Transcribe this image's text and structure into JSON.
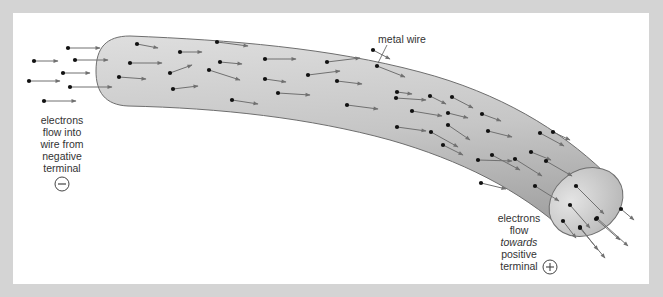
{
  "diagram": {
    "colors": {
      "frame": "#d4d4d4",
      "background": "#ffffff",
      "wire_fill_light": "#e2e2e2",
      "wire_fill_dark": "#a9a9a9",
      "wire_outline": "#6e6e6e",
      "electron": "#111111",
      "arrow": "#707070",
      "text": "#333333"
    },
    "labels": {
      "wire": "metal wire",
      "negative_end": [
        "electrons",
        "flow into",
        "wire from",
        "negative",
        "terminal"
      ],
      "positive_end": [
        "electrons",
        "flow",
        "towards",
        "positive",
        "terminal"
      ],
      "negative_symbol": "−",
      "positive_symbol": "+"
    },
    "electrons_outside_left": [
      [
        68,
        48,
        100,
        48
      ],
      [
        34,
        61,
        58,
        61
      ],
      [
        75,
        60,
        108,
        60
      ],
      [
        63,
        73,
        90,
        73
      ],
      [
        29,
        81,
        60,
        81
      ],
      [
        70,
        87,
        112,
        87
      ],
      [
        44,
        101,
        76,
        101
      ]
    ],
    "electrons_in_wire": [
      [
        137,
        44,
        158,
        48
      ],
      [
        180,
        52,
        202,
        52
      ],
      [
        130,
        63,
        162,
        63
      ],
      [
        170,
        73,
        192,
        65
      ],
      [
        119,
        77,
        146,
        79
      ],
      [
        209,
        70,
        240,
        80
      ],
      [
        173,
        89,
        198,
        86
      ],
      [
        217,
        42,
        248,
        46
      ],
      [
        220,
        62,
        242,
        64
      ],
      [
        232,
        100,
        258,
        104
      ],
      [
        265,
        59,
        296,
        59
      ],
      [
        265,
        79,
        286,
        82
      ],
      [
        308,
        75,
        340,
        71
      ],
      [
        278,
        93,
        310,
        95
      ],
      [
        327,
        62,
        360,
        58
      ],
      [
        337,
        81,
        362,
        84
      ],
      [
        377,
        66,
        405,
        77
      ],
      [
        373,
        50,
        390,
        59
      ],
      [
        397,
        92,
        412,
        94
      ],
      [
        347,
        105,
        378,
        109
      ],
      [
        396,
        98,
        426,
        100
      ],
      [
        430,
        96,
        446,
        104
      ],
      [
        452,
        97,
        473,
        108
      ],
      [
        412,
        111,
        442,
        116
      ],
      [
        397,
        127,
        426,
        131
      ],
      [
        448,
        113,
        468,
        118
      ],
      [
        448,
        125,
        470,
        140
      ],
      [
        482,
        114,
        501,
        121
      ],
      [
        488,
        131,
        512,
        137
      ],
      [
        478,
        160,
        512,
        161
      ],
      [
        431,
        132,
        458,
        147
      ],
      [
        540,
        133,
        564,
        146
      ],
      [
        443,
        145,
        463,
        155
      ],
      [
        492,
        155,
        520,
        170
      ],
      [
        531,
        152,
        551,
        160
      ],
      [
        546,
        161,
        572,
        176
      ],
      [
        481,
        183,
        506,
        189
      ],
      [
        515,
        159,
        542,
        176
      ],
      [
        535,
        186,
        559,
        201
      ],
      [
        553,
        132,
        570,
        140
      ]
    ],
    "electrons_in_endcap": [
      [
        576,
        186,
        604,
        214
      ],
      [
        570,
        205,
        590,
        228
      ],
      [
        563,
        221,
        576,
        238
      ],
      [
        596,
        219,
        620,
        240
      ],
      [
        580,
        227,
        598,
        250
      ]
    ],
    "electrons_outside_right": [
      [
        621,
        209,
        634,
        220
      ],
      [
        597,
        218,
        628,
        246
      ],
      [
        580,
        228,
        605,
        258
      ]
    ]
  }
}
